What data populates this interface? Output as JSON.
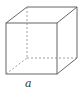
{
  "figure": {
    "caption": "a",
    "stroke_color": "#555555",
    "hidden_edge_color": "#888888",
    "vertices": {
      "front_top_left": [
        6,
        23
      ],
      "front_top_right": [
        57,
        23
      ],
      "front_bottom_left": [
        6,
        74
      ],
      "front_bottom_right": [
        57,
        74
      ],
      "back_top_left": [
        27,
        7
      ],
      "back_top_right": [
        77,
        7
      ],
      "back_bottom_right": [
        77,
        58
      ],
      "back_bottom_left": [
        27,
        58
      ]
    }
  }
}
